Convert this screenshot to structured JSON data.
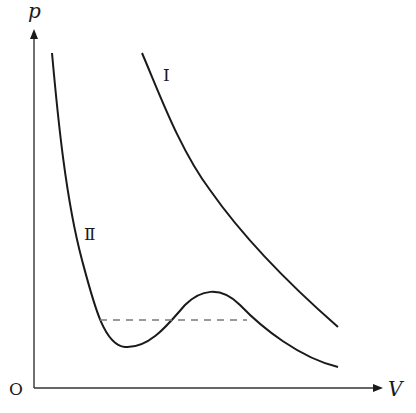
{
  "diagram": {
    "type": "p-V isotherm diagram",
    "axes": {
      "y_label": "p",
      "x_label": "V",
      "origin_label": "O"
    },
    "curves": [
      {
        "id": "I",
        "label": "I",
        "description": "monotonically decreasing isotherm (upper right)"
      },
      {
        "id": "II",
        "label": "Ⅱ",
        "description": "van der Waals-type isotherm with local minimum and maximum"
      }
    ],
    "dashed_line": {
      "description": "horizontal equal-area (Maxwell) line across curve II"
    },
    "colors": {
      "curve": "#1a1a1a",
      "axis": "#333333",
      "dashed": "#7a7a7a",
      "background": "#ffffff"
    }
  }
}
